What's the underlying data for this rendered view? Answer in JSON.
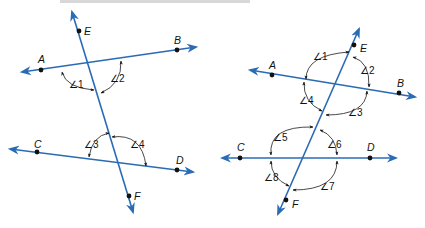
{
  "header": {
    "cropped_text": "…parallel lines cut by a transversal… ∠ … ∠ …"
  },
  "colors": {
    "line": "#2a6bb5",
    "ink": "#111111"
  },
  "figures": [
    {
      "id": "left",
      "points": {
        "A": "A",
        "B": "B",
        "C": "C",
        "D": "D",
        "E": "E",
        "F": "F"
      },
      "angles": [
        "∠1",
        "∠2",
        "∠3",
        "∠4"
      ]
    },
    {
      "id": "right",
      "points": {
        "A": "A",
        "B": "B",
        "C": "C",
        "D": "D",
        "E": "E",
        "F": "F"
      },
      "angles": [
        "∠1",
        "∠2",
        "∠3",
        "∠4",
        "∠5",
        "∠6",
        "∠7",
        "∠8"
      ]
    }
  ]
}
